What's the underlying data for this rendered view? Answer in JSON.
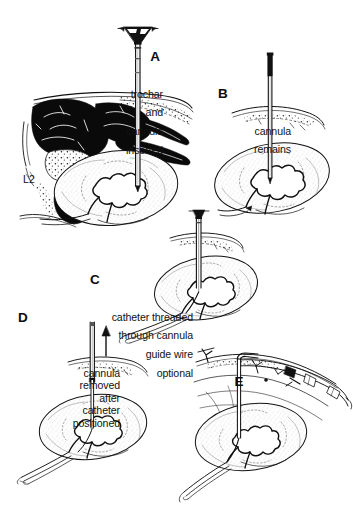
{
  "figure": {
    "background_color": "#ffffff",
    "ink_color": "#111111",
    "fill_dark": "#0a0a0a",
    "stipple_color": "#9a9a9a",
    "width": 353,
    "height": 517
  },
  "panels": [
    {
      "id": "A",
      "letter": "A",
      "caption": "trochar\nand\ncannula\ninserted",
      "caption_lines": [
        "trochar",
        "and",
        "cannula",
        "inserted"
      ],
      "align": "right",
      "anatomy_labels": [
        "L2"
      ],
      "instrument": "trochar-and-cannula"
    },
    {
      "id": "B",
      "letter": "B",
      "caption": "cannula\nremains",
      "caption_lines": [
        "cannula",
        "remains"
      ],
      "align": "right",
      "anatomy_labels": [],
      "instrument": "cannula"
    },
    {
      "id": "C",
      "letter": "C",
      "caption": "catheter threaded\nthrough cannula\nguide wire\noptional",
      "caption_lines": [
        "catheter threaded",
        "through cannula",
        "guide wire",
        "optional"
      ],
      "align": "right",
      "anatomy_labels": [],
      "instrument": "catheter-in-cannula"
    },
    {
      "id": "D",
      "letter": "D",
      "caption": "cannula\nremoved\nafter\ncatheter\npositioned",
      "caption_lines": [
        "cannula",
        "removed",
        "after",
        "catheter",
        "positioned"
      ],
      "align": "right",
      "anatomy_labels": [],
      "instrument": "cannula-withdrawing",
      "arrow_direction": "up"
    },
    {
      "id": "E",
      "letter": "E",
      "caption": "",
      "caption_lines": [],
      "align": "center",
      "anatomy_labels": [],
      "instrument": "secured-catheter-with-tubing"
    }
  ],
  "labels": {
    "vertebra": "L2"
  }
}
